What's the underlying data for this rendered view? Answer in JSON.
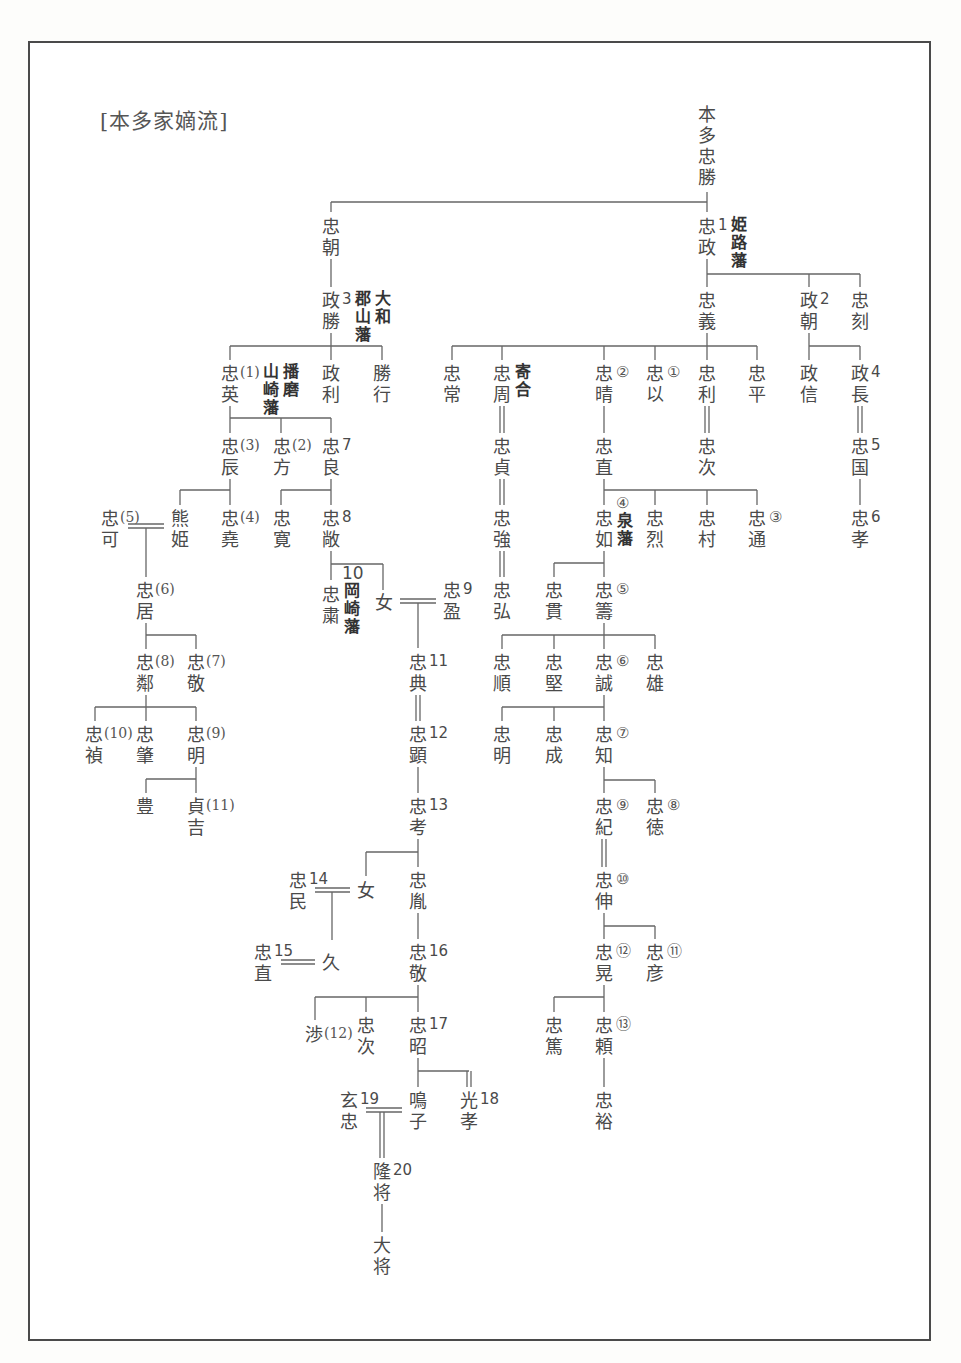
{
  "title": "[本多家嫡流]",
  "nodes": [
    {
      "id": "tadakatsu",
      "chars": [
        "本",
        "多",
        "忠",
        "勝"
      ],
      "x": 697,
      "y": 104
    },
    {
      "id": "tadatomo",
      "chars": [
        "忠",
        "朝"
      ],
      "x": 321,
      "y": 216
    },
    {
      "id": "tadamasa",
      "chars": [
        "忠",
        "政"
      ],
      "x": 697,
      "y": 216,
      "num": "1",
      "domain": [
        [
          "姫",
          "路",
          "藩"
        ]
      ]
    },
    {
      "id": "masakatsu",
      "chars": [
        "政",
        "勝"
      ],
      "x": 321,
      "y": 290,
      "num": "3",
      "domain": [
        [
          "郡",
          "山",
          "藩"
        ],
        [
          "大",
          "和"
        ]
      ]
    },
    {
      "id": "tadayoshi",
      "chars": [
        "忠",
        "義"
      ],
      "x": 697,
      "y": 290
    },
    {
      "id": "masatomo",
      "chars": [
        "政",
        "朝"
      ],
      "x": 799,
      "y": 290,
      "num": "2"
    },
    {
      "id": "tadatoki",
      "chars": [
        "忠",
        "刻"
      ],
      "x": 850,
      "y": 290
    },
    {
      "id": "tadahide",
      "chars": [
        "忠",
        "英"
      ],
      "x": 220,
      "y": 363,
      "paren": "(1)",
      "domain": [
        [
          "山",
          "崎",
          "藩"
        ],
        [
          "播",
          "磨"
        ]
      ]
    },
    {
      "id": "masatoshi",
      "chars": [
        "政",
        "利"
      ],
      "x": 321,
      "y": 363
    },
    {
      "id": "katsuyuki",
      "chars": [
        "勝",
        "行"
      ],
      "x": 372,
      "y": 363
    },
    {
      "id": "tadatsune",
      "chars": [
        "忠",
        "常"
      ],
      "x": 442,
      "y": 363
    },
    {
      "id": "tadachika",
      "chars": [
        "忠",
        "周"
      ],
      "x": 492,
      "y": 363,
      "domain": [
        [
          "寄",
          "合"
        ]
      ]
    },
    {
      "id": "tadaharu",
      "chars": [
        "忠",
        "晴"
      ],
      "x": 594,
      "y": 363,
      "circ": "②"
    },
    {
      "id": "tadamochi",
      "chars": [
        "忠",
        "以"
      ],
      "x": 645,
      "y": 363,
      "circ": "①"
    },
    {
      "id": "tadatoshi",
      "chars": [
        "忠",
        "利"
      ],
      "x": 697,
      "y": 363
    },
    {
      "id": "tadahira",
      "chars": [
        "忠",
        "平"
      ],
      "x": 747,
      "y": 363
    },
    {
      "id": "masanobu",
      "chars": [
        "政",
        "信"
      ],
      "x": 799,
      "y": 363
    },
    {
      "id": "masanaga",
      "chars": [
        "政",
        "長"
      ],
      "x": 850,
      "y": 363,
      "num": "4"
    },
    {
      "id": "tadatoki2",
      "chars": [
        "忠",
        "辰"
      ],
      "x": 220,
      "y": 436,
      "paren": "(3)"
    },
    {
      "id": "tadamasa2",
      "chars": [
        "忠",
        "方"
      ],
      "x": 272,
      "y": 436,
      "paren": "(2)"
    },
    {
      "id": "tadayoshi2",
      "chars": [
        "忠",
        "良"
      ],
      "x": 321,
      "y": 436,
      "num": "7"
    },
    {
      "id": "tadasada",
      "chars": [
        "忠",
        "貞"
      ],
      "x": 492,
      "y": 436
    },
    {
      "id": "tadanao",
      "chars": [
        "忠",
        "直"
      ],
      "x": 594,
      "y": 436
    },
    {
      "id": "tadatsugu",
      "chars": [
        "忠",
        "次"
      ],
      "x": 697,
      "y": 436
    },
    {
      "id": "tadakuni",
      "chars": [
        "忠",
        "国"
      ],
      "x": 850,
      "y": 436,
      "num": "5"
    },
    {
      "id": "tadayoshi3",
      "chars": [
        "忠",
        "可"
      ],
      "x": 100,
      "y": 508,
      "paren": "(5)"
    },
    {
      "id": "kumahime",
      "chars": [
        "熊",
        "姫"
      ],
      "x": 170,
      "y": 508
    },
    {
      "id": "tadataka",
      "chars": [
        "忠",
        "堯"
      ],
      "x": 220,
      "y": 508,
      "paren": "(4)"
    },
    {
      "id": "tadahiro",
      "chars": [
        "忠",
        "寛"
      ],
      "x": 272,
      "y": 508
    },
    {
      "id": "tadatoshi2",
      "chars": [
        "忠",
        "敞"
      ],
      "x": 321,
      "y": 508,
      "num": "8"
    },
    {
      "id": "tadatsuyo",
      "chars": [
        "忠",
        "強"
      ],
      "x": 492,
      "y": 508
    },
    {
      "id": "tadayuki",
      "chars": [
        "忠",
        "如"
      ],
      "x": 594,
      "y": 508,
      "circ_top": "④",
      "domain": [
        [
          "泉",
          "藩"
        ]
      ]
    },
    {
      "id": "tadayasu",
      "chars": [
        "忠",
        "烈"
      ],
      "x": 645,
      "y": 508
    },
    {
      "id": "tadamura",
      "chars": [
        "忠",
        "村"
      ],
      "x": 697,
      "y": 508
    },
    {
      "id": "tadamichi",
      "chars": [
        "忠",
        "通"
      ],
      "x": 747,
      "y": 508,
      "circ": "③"
    },
    {
      "id": "tadataka2",
      "chars": [
        "忠",
        "孝"
      ],
      "x": 850,
      "y": 508,
      "num": "6"
    },
    {
      "id": "tadaoki",
      "chars": [
        "忠",
        "居"
      ],
      "x": 135,
      "y": 580,
      "paren": "(6)"
    },
    {
      "id": "tadakiyo",
      "chars": [
        "忠",
        "粛"
      ],
      "x": 321,
      "y": 584,
      "num_top": "10",
      "domain": [
        [
          "岡",
          "崎",
          "藩"
        ]
      ]
    },
    {
      "id": "onna1",
      "chars": [
        "女"
      ],
      "x": 374,
      "y": 592
    },
    {
      "id": "tadamitsu",
      "chars": [
        "忠",
        "盈"
      ],
      "x": 442,
      "y": 580,
      "num": "9"
    },
    {
      "id": "tadahiro2",
      "chars": [
        "忠",
        "弘"
      ],
      "x": 492,
      "y": 580
    },
    {
      "id": "tadatsura",
      "chars": [
        "忠",
        "貫"
      ],
      "x": 544,
      "y": 580
    },
    {
      "id": "tadakazu",
      "chars": [
        "忠",
        "籌"
      ],
      "x": 594,
      "y": 580,
      "circ": "⑤"
    },
    {
      "id": "tadachika2",
      "chars": [
        "忠",
        "鄰"
      ],
      "x": 135,
      "y": 652,
      "paren": "(8)"
    },
    {
      "id": "tadataka3",
      "chars": [
        "忠",
        "敬"
      ],
      "x": 186,
      "y": 652,
      "paren": "(7)"
    },
    {
      "id": "tadanori",
      "chars": [
        "忠",
        "典"
      ],
      "x": 408,
      "y": 652,
      "num": "11"
    },
    {
      "id": "tadayori",
      "chars": [
        "忠",
        "順"
      ],
      "x": 492,
      "y": 652
    },
    {
      "id": "tadakata",
      "chars": [
        "忠",
        "堅"
      ],
      "x": 544,
      "y": 652
    },
    {
      "id": "tadazane",
      "chars": [
        "忠",
        "誠"
      ],
      "x": 594,
      "y": 652,
      "circ": "⑥"
    },
    {
      "id": "tadakatsu2",
      "chars": [
        "忠",
        "雄"
      ],
      "x": 645,
      "y": 652
    },
    {
      "id": "tadasada2",
      "chars": [
        "忠",
        "禎"
      ],
      "x": 84,
      "y": 724,
      "paren": "(10)"
    },
    {
      "id": "tadatoshi3",
      "chars": [
        "忠",
        "肇"
      ],
      "x": 135,
      "y": 724
    },
    {
      "id": "tadaaki",
      "chars": [
        "忠",
        "明"
      ],
      "x": 186,
      "y": 724,
      "paren": "(9)"
    },
    {
      "id": "tadaaki2",
      "chars": [
        "忠",
        "顕"
      ],
      "x": 408,
      "y": 724,
      "num": "12"
    },
    {
      "id": "tadaaki3",
      "chars": [
        "忠",
        "明"
      ],
      "x": 492,
      "y": 724
    },
    {
      "id": "tadashige",
      "chars": [
        "忠",
        "成"
      ],
      "x": 544,
      "y": 724
    },
    {
      "id": "tadatomo2",
      "chars": [
        "忠",
        "知"
      ],
      "x": 594,
      "y": 724,
      "circ": "⑦"
    },
    {
      "id": "yutaka",
      "chars": [
        "豊"
      ],
      "x": 135,
      "y": 796
    },
    {
      "id": "sadayoshi",
      "chars": [
        "貞",
        "吉"
      ],
      "x": 186,
      "y": 796,
      "paren": "(11)"
    },
    {
      "id": "tadataka4",
      "chars": [
        "忠",
        "考"
      ],
      "x": 408,
      "y": 796,
      "num": "13"
    },
    {
      "id": "tadanori2",
      "chars": [
        "忠",
        "紀"
      ],
      "x": 594,
      "y": 796,
      "circ": "⑨"
    },
    {
      "id": "tadayoshi4",
      "chars": [
        "忠",
        "徳"
      ],
      "x": 645,
      "y": 796,
      "circ": "⑧"
    },
    {
      "id": "tadatami",
      "chars": [
        "忠",
        "民"
      ],
      "x": 288,
      "y": 870,
      "num": "14"
    },
    {
      "id": "onna2",
      "chars": [
        "女"
      ],
      "x": 356,
      "y": 880
    },
    {
      "id": "tadakazu2",
      "chars": [
        "忠",
        "胤"
      ],
      "x": 408,
      "y": 870
    },
    {
      "id": "tadanobu",
      "chars": [
        "忠",
        "伸"
      ],
      "x": 594,
      "y": 870,
      "circ": "⑩"
    },
    {
      "id": "tadanao2",
      "chars": [
        "忠",
        "直"
      ],
      "x": 253,
      "y": 942,
      "num": "15"
    },
    {
      "id": "hisa",
      "chars": [
        "久"
      ],
      "x": 321,
      "y": 952
    },
    {
      "id": "tadataka5",
      "chars": [
        "忠",
        "敬"
      ],
      "x": 408,
      "y": 942,
      "num": "16"
    },
    {
      "id": "tadaakira",
      "chars": [
        "忠",
        "晃"
      ],
      "x": 594,
      "y": 942,
      "circ": "⑫"
    },
    {
      "id": "tadahiko",
      "chars": [
        "忠",
        "彦"
      ],
      "x": 645,
      "y": 942,
      "circ": "⑪"
    },
    {
      "id": "wataru",
      "chars": [
        "渉"
      ],
      "x": 304,
      "y": 1024,
      "paren": "(12)"
    },
    {
      "id": "tadatsugu2",
      "chars": [
        "忠",
        "次"
      ],
      "x": 356,
      "y": 1015
    },
    {
      "id": "tadaaki4",
      "chars": [
        "忠",
        "昭"
      ],
      "x": 408,
      "y": 1015,
      "num": "17"
    },
    {
      "id": "tadaatsu",
      "chars": [
        "忠",
        "篤"
      ],
      "x": 544,
      "y": 1015
    },
    {
      "id": "tadayori2",
      "chars": [
        "忠",
        "頼"
      ],
      "x": 594,
      "y": 1015,
      "circ": "⑬"
    },
    {
      "id": "gentada",
      "chars": [
        "玄",
        "忠"
      ],
      "x": 339,
      "y": 1090,
      "num": "19"
    },
    {
      "id": "meiko",
      "chars": [
        "鳴",
        "子"
      ],
      "x": 408,
      "y": 1090
    },
    {
      "id": "mitsutaka",
      "chars": [
        "光",
        "孝"
      ],
      "x": 459,
      "y": 1090,
      "num": "18"
    },
    {
      "id": "tadahiro3",
      "chars": [
        "忠",
        "裕"
      ],
      "x": 594,
      "y": 1090
    },
    {
      "id": "takamasa",
      "chars": [
        "隆",
        "将"
      ],
      "x": 372,
      "y": 1161,
      "num": "20"
    },
    {
      "id": "hiromasa",
      "chars": [
        "大",
        "将"
      ],
      "x": 372,
      "y": 1235
    }
  ]
}
